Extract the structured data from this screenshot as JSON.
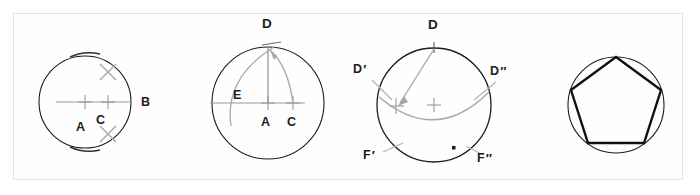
{
  "figure": {
    "title_visible": false,
    "border_color": "#e3e3e3",
    "background": "#ffffff",
    "ink_color": "#1c1c1c",
    "construction_color": "#a8a8a8",
    "panel_count": 4
  },
  "panels": [
    {
      "name": "step-1-bisect-radius",
      "circle": {
        "cx": 85,
        "cy": 102,
        "r": 46
      },
      "labels": [
        {
          "id": "A",
          "text": "A",
          "x": 77,
          "y": 120
        },
        {
          "id": "C",
          "text": "C",
          "x": 96,
          "y": 115
        },
        {
          "id": "B",
          "text": "B",
          "x": 142,
          "y": 96
        }
      ],
      "markers": [
        "center-cross-A",
        "cross-C",
        "arc-intersection-upper-x",
        "arc-intersection-lower-x"
      ],
      "construction_lines": [
        "diameter-A-to-B",
        "bisector-x-marks"
      ]
    },
    {
      "name": "step-2-mark-point-D-and-E",
      "circle": {
        "cx": 268,
        "cy": 103,
        "r": 56
      },
      "labels": [
        {
          "id": "D",
          "text": "D",
          "x": 263,
          "y": 19
        },
        {
          "id": "E",
          "text": "E",
          "x": 234,
          "y": 94
        },
        {
          "id": "A",
          "text": "A",
          "x": 261,
          "y": 121
        },
        {
          "id": "C",
          "text": "C",
          "x": 287,
          "y": 121
        }
      ],
      "markers": [
        "center-cross-A",
        "cross-C",
        "tick-D"
      ],
      "construction_lines": [
        "radius-A-to-D",
        "arc-C-to-D",
        "arc-D-to-E",
        "horizontal-diameter"
      ]
    },
    {
      "name": "step-3-step-off-chords",
      "circle": {
        "cx": 434,
        "cy": 105,
        "r": 57
      },
      "labels": [
        {
          "id": "D",
          "text": "D",
          "x": 428,
          "y": 20
        },
        {
          "id": "Dprime",
          "text": "D",
          "prime": "′",
          "x": 354,
          "y": 68
        },
        {
          "id": "Ddoubleprime",
          "text": "D",
          "prime": "″",
          "x": 492,
          "y": 70
        },
        {
          "id": "Fprime",
          "text": "F",
          "prime": "′",
          "x": 364,
          "y": 154
        },
        {
          "id": "Fdoubleprime",
          "text": "F",
          "prime": "″",
          "x": 478,
          "y": 157
        }
      ],
      "markers": [
        "center-cross",
        "tick-D",
        "cross-D-prime",
        "dot-marker",
        "leader-D-prime",
        "leader-D-double-prime",
        "leader-F-prime",
        "leader-F-double-prime"
      ],
      "construction_lines": [
        "chord-D-to-D-prime",
        "arc-D-prime-to-D-double-prime"
      ]
    },
    {
      "name": "step-4-completed-pentagon",
      "circle": {
        "cx": 616,
        "cy": 105,
        "r": 48
      },
      "labels": [],
      "markers": [
        "inscribed-regular-pentagon"
      ],
      "construction_lines": [
        "pentagon-edges"
      ]
    }
  ]
}
